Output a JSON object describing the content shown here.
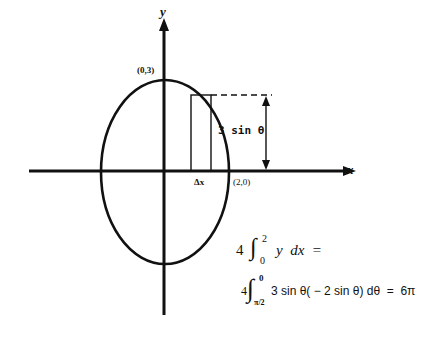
{
  "diagram": {
    "axes": {
      "x_label": "x",
      "y_label": "y"
    },
    "ellipse": {
      "semi_axis_x": 2,
      "semi_axis_y": 3,
      "center": [
        0,
        0
      ]
    },
    "points": {
      "top": "(0,3)",
      "right": "(2,0)"
    },
    "strip": {
      "width_label": "Δx",
      "height_label": "3 sin θ"
    },
    "formulas": {
      "line1": {
        "coefficient": "4",
        "upper": "2",
        "lower": "0",
        "integrand": "y  dx  ="
      },
      "line2": {
        "coefficient": "4",
        "upper": "0",
        "lower": "π/2",
        "integrand": "3 sin θ( − 2 sin θ) dθ  =  6π"
      }
    },
    "colors": {
      "ink": "#111111",
      "background": "#ffffff"
    }
  }
}
